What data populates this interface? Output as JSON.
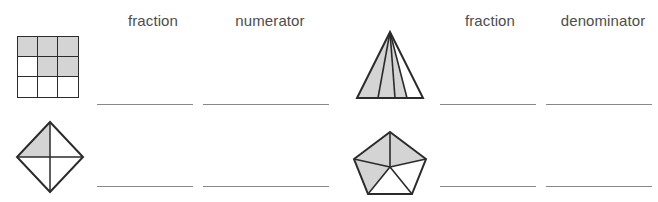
{
  "page": {
    "background_color": "#ffffff",
    "shape_outline_color": "#2b2b2b",
    "shape_shade_color": "#d4d4d4",
    "answer_line_color": "#888888",
    "text_color": "#4d4d4d"
  },
  "sections": [
    {
      "id": "left",
      "headers": [
        {
          "label": "fraction"
        },
        {
          "label": "numerator"
        }
      ],
      "rows": [
        {
          "shape": "three-by-three-grid",
          "shaded_parts": 5,
          "total_parts": 9,
          "fraction_answer": "",
          "second_answer": ""
        },
        {
          "shape": "diamond-quartered",
          "shaded_parts": 1,
          "total_parts": 4,
          "fraction_answer": "",
          "second_answer": ""
        }
      ]
    },
    {
      "id": "right",
      "headers": [
        {
          "label": "fraction"
        },
        {
          "label": "denominator"
        }
      ],
      "rows": [
        {
          "shape": "triangle-quartered",
          "shaded_parts": 3,
          "total_parts": 4,
          "fraction_answer": "",
          "second_answer": ""
        },
        {
          "shape": "pentagon-fifths",
          "shaded_parts": 3,
          "total_parts": 5,
          "fraction_answer": "",
          "second_answer": ""
        }
      ]
    }
  ]
}
